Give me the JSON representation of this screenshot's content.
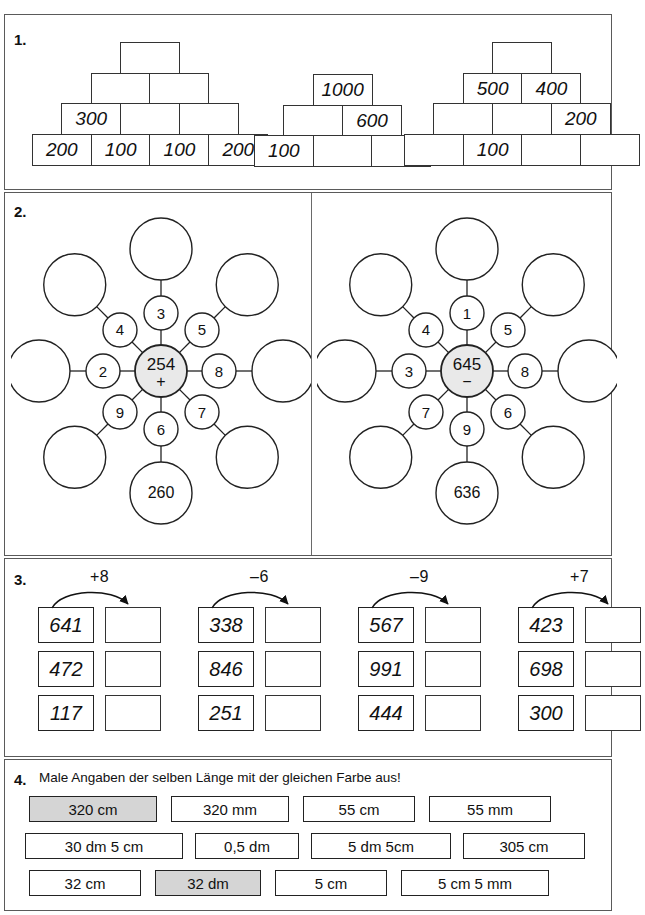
{
  "header": {
    "ghost_text": ""
  },
  "tasks": [
    {
      "number": "1."
    },
    {
      "number": "2."
    },
    {
      "number": "3."
    },
    {
      "number": "4."
    }
  ],
  "task1": {
    "number": "1.",
    "pyramids": [
      {
        "id": "pyramid-1",
        "rows": [
          {
            "cells": [
              ""
            ]
          },
          {
            "cells": [
              "",
              ""
            ]
          },
          {
            "cells": [
              "300",
              "",
              ""
            ]
          },
          {
            "cells": [
              "200",
              "100",
              "100",
              "200"
            ]
          }
        ]
      },
      {
        "id": "pyramid-2",
        "rows": [
          {
            "cells": [
              "1000"
            ]
          },
          {
            "cells": [
              "",
              "600"
            ]
          },
          {
            "cells": [
              "100",
              "",
              ""
            ]
          }
        ]
      },
      {
        "id": "pyramid-3",
        "rows": [
          {
            "cells": [
              ""
            ]
          },
          {
            "cells": [
              "500",
              "400"
            ]
          },
          {
            "cells": [
              "",
              "",
              "200"
            ]
          },
          {
            "cells": [
              "",
              "100",
              "",
              ""
            ]
          }
        ]
      }
    ]
  },
  "task2": {
    "number": "2.",
    "wheels": [
      {
        "id": "wheel-left",
        "center_value": "254",
        "center_operator": "+",
        "center_fill": "#e9e9e9",
        "spokes": [
          {
            "position": "top",
            "inner": "3",
            "outer": ""
          },
          {
            "position": "upper-right",
            "inner": "5",
            "outer": ""
          },
          {
            "position": "right",
            "inner": "8",
            "outer": ""
          },
          {
            "position": "lower-right",
            "inner": "7",
            "outer": ""
          },
          {
            "position": "bottom",
            "inner": "6",
            "outer": "260"
          },
          {
            "position": "lower-left",
            "inner": "9",
            "outer": ""
          },
          {
            "position": "left",
            "inner": "2",
            "outer": ""
          },
          {
            "position": "upper-left",
            "inner": "4",
            "outer": ""
          }
        ]
      },
      {
        "id": "wheel-right",
        "center_value": "645",
        "center_operator": "−",
        "center_fill": "#e9e9e9",
        "spokes": [
          {
            "position": "top",
            "inner": "1",
            "outer": ""
          },
          {
            "position": "upper-right",
            "inner": "5",
            "outer": ""
          },
          {
            "position": "right",
            "inner": "8",
            "outer": ""
          },
          {
            "position": "lower-right",
            "inner": "6",
            "outer": ""
          },
          {
            "position": "bottom",
            "inner": "9",
            "outer": "636"
          },
          {
            "position": "lower-left",
            "inner": "7",
            "outer": ""
          },
          {
            "position": "left",
            "inner": "3",
            "outer": ""
          },
          {
            "position": "upper-left",
            "inner": "4",
            "outer": ""
          }
        ]
      }
    ]
  },
  "task3": {
    "number": "3.",
    "columns": [
      {
        "operation": "+8",
        "rows": [
          {
            "start": "641",
            "result": ""
          },
          {
            "start": "472",
            "result": ""
          },
          {
            "start": "117",
            "result": ""
          }
        ]
      },
      {
        "operation": "–6",
        "rows": [
          {
            "start": "338",
            "result": ""
          },
          {
            "start": "846",
            "result": ""
          },
          {
            "start": "251",
            "result": ""
          }
        ]
      },
      {
        "operation": "–9",
        "rows": [
          {
            "start": "567",
            "result": ""
          },
          {
            "start": "991",
            "result": ""
          },
          {
            "start": "444",
            "result": ""
          }
        ]
      },
      {
        "operation": "+7",
        "rows": [
          {
            "start": "423",
            "result": ""
          },
          {
            "start": "698",
            "result": ""
          },
          {
            "start": "300",
            "result": ""
          }
        ]
      }
    ]
  },
  "task4": {
    "number": "4.",
    "instruction": "Male Angaben der selben Länge mit der gleichen Farbe aus!",
    "shaded_color": "#d5d5d5",
    "rows": [
      {
        "boxes": [
          {
            "label": "320 cm",
            "shaded": true,
            "width": 128
          },
          {
            "label": "320 mm",
            "shaded": false,
            "width": 118
          },
          {
            "label": "55 cm",
            "shaded": false,
            "width": 112
          },
          {
            "label": "55 mm",
            "shaded": false,
            "width": 122
          }
        ]
      },
      {
        "boxes": [
          {
            "label": "30 dm 5 cm",
            "shaded": false,
            "width": 158
          },
          {
            "label": "0,5 dm",
            "shaded": false,
            "width": 104
          },
          {
            "label": "5 dm 5cm",
            "shaded": false,
            "width": 140
          },
          {
            "label": "305 cm",
            "shaded": false,
            "width": 122
          }
        ]
      },
      {
        "boxes": [
          {
            "label": "32 cm",
            "shaded": false,
            "width": 112
          },
          {
            "label": "32 dm",
            "shaded": true,
            "width": 106
          },
          {
            "label": "5 cm",
            "shaded": false,
            "width": 112
          },
          {
            "label": "5 cm 5 mm",
            "shaded": false,
            "width": 148
          }
        ]
      }
    ]
  }
}
